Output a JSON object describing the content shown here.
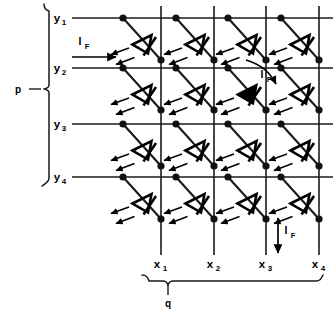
{
  "diagram": {
    "row_group_label": "p",
    "col_group_label": "q",
    "row_labels": [
      "y",
      "y",
      "y",
      "y"
    ],
    "row_subscripts": [
      "1",
      "2",
      "3",
      "4"
    ],
    "col_labels": [
      "x",
      "x",
      "x",
      "x"
    ],
    "col_subscripts": [
      "1",
      "2",
      "3",
      "4"
    ],
    "current_label": "I",
    "current_subscript": "F",
    "rows": 4,
    "columns": 4,
    "active_cell": {
      "row": 2,
      "column": 3
    },
    "colors": {
      "background": "#ffffff",
      "ink": "#111111",
      "wire": "#1a1a1a",
      "active_fill": "#000000"
    },
    "geometry": {
      "row_y": [
        18,
        68,
        124,
        177
      ],
      "col_x": [
        161,
        214,
        266,
        319
      ],
      "anode_x": [
        123,
        176,
        228,
        281
      ],
      "grid_left": 72,
      "grid_right": 333,
      "grid_top": 6,
      "grid_bottom": 255
    },
    "current_markers": [
      {
        "name": "input-current-row2",
        "label": "I",
        "subscript": "F",
        "direction": "right"
      },
      {
        "name": "cell-current-r2c3",
        "label": "I",
        "subscript": "F",
        "direction": "diagonal"
      },
      {
        "name": "output-current-col3",
        "label": "I",
        "subscript": "F",
        "direction": "down"
      }
    ],
    "icons": {
      "led": "led-diode-icon",
      "node": "junction-dot-icon",
      "emission": "light-ray-arrow-icon",
      "brace": "curly-brace-icon",
      "arrow": "current-arrow-icon"
    }
  }
}
